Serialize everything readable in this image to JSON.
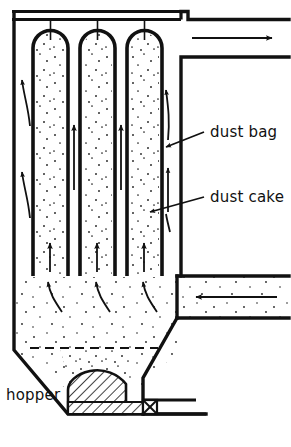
{
  "diagram": {
    "type": "engineering-cross-section",
    "background_color": "#ffffff",
    "line_color": "#111111",
    "dot_color": "#222222",
    "labels": {
      "dust_bag": "dust bag",
      "dust_cake": "dust cake",
      "hopper": "hopper"
    },
    "components": {
      "housing": "filter housing shell",
      "roof_plate": "tube sheet / roof plate",
      "bags": [
        {
          "name": "dust-bag-1",
          "x": 33,
          "width": 29
        },
        {
          "name": "dust-bag-2",
          "x": 80,
          "width": 29
        },
        {
          "name": "dust-bag-3",
          "x": 127,
          "width": 29
        }
      ],
      "clean_gas_outlet_duct": "clean gas outlet duct (upper right)",
      "dirty_gas_inlet_duct": "dirty gas inlet duct (lower right)",
      "hopper_cone": "tapered hopper cone",
      "collected_dust_pile": "hatched collected dust pile",
      "discharge_duct": "screw / discharge duct",
      "discharge_valve": "discharge valve (X symbol)",
      "dust_level_line": "dashed dust level line"
    },
    "flow_arrows": {
      "outlet_direction": "right",
      "inlet_direction": "left",
      "bag_interior_direction": "up",
      "cake_entry_direction": "curved inward",
      "hopper_entry_direction": "curved upward"
    }
  }
}
